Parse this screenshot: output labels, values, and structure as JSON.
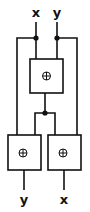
{
  "diagram": {
    "inputs": [
      {
        "label": "x"
      },
      {
        "label": "y"
      }
    ],
    "outputs": [
      {
        "label": "y"
      },
      {
        "label": "x"
      }
    ],
    "gates": [
      {
        "name": "top-xor",
        "symbol": "xor"
      },
      {
        "name": "bottom-left-xor",
        "symbol": "xor"
      },
      {
        "name": "bottom-right-xor",
        "symbol": "xor"
      }
    ],
    "colors": {
      "stroke": "#111111",
      "background": "#ffffff"
    }
  }
}
